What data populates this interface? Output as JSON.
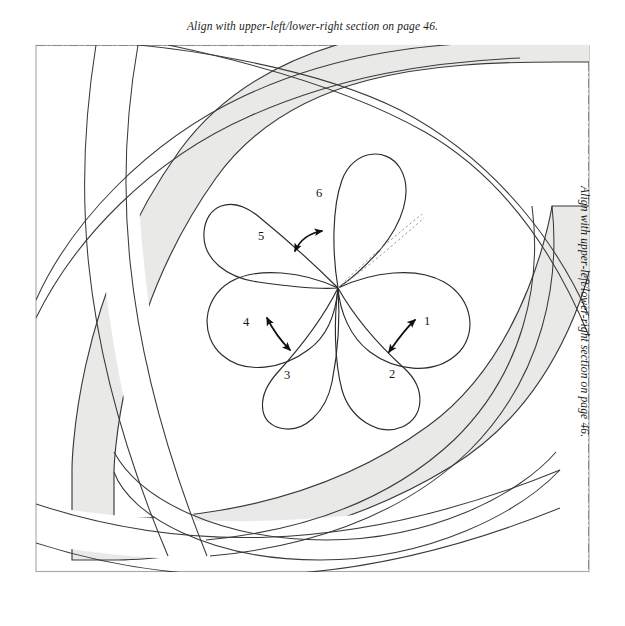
{
  "page": {
    "width": 625,
    "height": 626,
    "background_color": "#ffffff",
    "border_color": "#9a9a9a"
  },
  "annotations": {
    "top_align_text": "Align with upper-left/lower-right section on page 46.",
    "right_align_text": "Align with upper-left/lower-right section on page 46."
  },
  "colors": {
    "ink": "#2b2b2b",
    "band_fill": "#e9e9e7",
    "band_stroke": "#3a3a3a",
    "dash_guide": "#8a8a8a",
    "page_border": "#a6a6a4",
    "arrow": "#111111",
    "dashed_curve": "#9d9d9d"
  },
  "flower": {
    "center": {
      "x": 338,
      "y": 288
    },
    "petal_count": 6,
    "petals": [
      {
        "id": "petal-1",
        "number": "1",
        "label_x": 427,
        "label_y": 321,
        "angle_deg": 8
      },
      {
        "id": "petal-2",
        "number": "2",
        "label_x": 392,
        "label_y": 374,
        "angle_deg": 52
      },
      {
        "id": "petal-3",
        "number": "3",
        "label_x": 287,
        "label_y": 375,
        "angle_deg": 118
      },
      {
        "id": "petal-4",
        "number": "4",
        "label_x": 246,
        "label_y": 322,
        "angle_deg": 168
      },
      {
        "id": "petal-5",
        "number": "5",
        "label_x": 261,
        "label_y": 236,
        "angle_deg": 212
      },
      {
        "id": "petal-6",
        "number": "6",
        "label_x": 319,
        "label_y": 193,
        "angle_deg": 268
      }
    ],
    "arrows": [
      {
        "id": "arrow-petal-1-2",
        "between": [
          "1",
          "2"
        ]
      },
      {
        "id": "arrow-petal-3-4",
        "between": [
          "3",
          "4"
        ]
      },
      {
        "id": "arrow-petal-5-6",
        "between": [
          "5",
          "6"
        ]
      }
    ],
    "dashed_guides": 2
  },
  "guides": {
    "top_dashed_line": true,
    "right_dashed_line": true
  }
}
